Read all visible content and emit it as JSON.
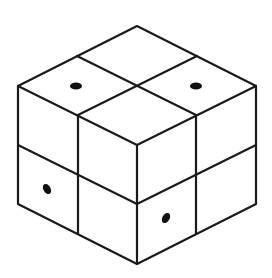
{
  "diagram": {
    "colors": {
      "background": "#ffffff",
      "stroke": "#1a1a1a",
      "dot": "#111111"
    },
    "grid": {
      "size": [
        2,
        2,
        2
      ]
    },
    "vertices": {
      "top": [
        137,
        26
      ],
      "top_left": [
        18,
        86
      ],
      "top_right": [
        256,
        86
      ],
      "front_top": [
        137,
        145
      ],
      "mid_left": [
        18,
        145
      ],
      "mid_right": [
        256,
        145
      ],
      "front_mid": [
        137,
        204
      ],
      "bottom_left": [
        18,
        204
      ],
      "bottom_right": [
        256,
        204
      ],
      "bottom": [
        137,
        264
      ]
    },
    "dots": [
      {
        "face": "top",
        "cell": "left",
        "cx": 76,
        "cy": 86,
        "rx": 6,
        "ry": 3.6,
        "rotate": 0
      },
      {
        "face": "top",
        "cell": "right",
        "cx": 196,
        "cy": 86,
        "rx": 6,
        "ry": 3.6,
        "rotate": 0
      },
      {
        "face": "left",
        "cell": "bottom-left",
        "cx": 47,
        "cy": 189,
        "rx": 3.6,
        "ry": 5.5,
        "rotate": -30
      },
      {
        "face": "right",
        "cell": "bottom-left",
        "cx": 166,
        "cy": 218,
        "rx": 3.6,
        "ry": 5.5,
        "rotate": 30
      }
    ]
  }
}
